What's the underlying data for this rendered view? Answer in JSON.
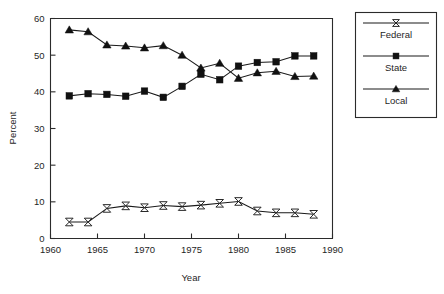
{
  "chart_data": {
    "type": "line",
    "title": "",
    "xlabel": "Year",
    "ylabel": "Percent",
    "xlim": [
      1960,
      1990
    ],
    "ylim": [
      0,
      60
    ],
    "xticks": [
      1960,
      1965,
      1970,
      1975,
      1980,
      1985,
      1990
    ],
    "yticks": [
      0,
      10,
      20,
      30,
      40,
      50,
      60
    ],
    "grid": false,
    "legend_position": "right-outside",
    "x": [
      1962,
      1964,
      1966,
      1968,
      1970,
      1972,
      1974,
      1976,
      1978,
      1980,
      1982,
      1984,
      1986,
      1988
    ],
    "series": [
      {
        "name": "Federal",
        "marker": "bowtie",
        "values": [
          4.5,
          4.5,
          8.2,
          8.9,
          8.4,
          9.0,
          8.7,
          9.1,
          9.6,
          10.1,
          7.5,
          7.0,
          7.0,
          6.6
        ]
      },
      {
        "name": "State",
        "marker": "square",
        "values": [
          38.9,
          39.5,
          39.3,
          38.8,
          40.2,
          38.5,
          41.5,
          44.8,
          43.3,
          47.0,
          48.0,
          48.2,
          49.8,
          49.8
        ]
      },
      {
        "name": "Local",
        "marker": "triangle",
        "values": [
          56.9,
          56.4,
          52.8,
          52.5,
          52.0,
          52.6,
          50.0,
          46.5,
          47.8,
          43.7,
          45.2,
          45.6,
          44.2,
          44.3
        ]
      }
    ]
  },
  "legend": {
    "entries": [
      {
        "label": "Federal",
        "marker": "bowtie"
      },
      {
        "label": "State",
        "marker": "square"
      },
      {
        "label": "Local",
        "marker": "triangle"
      }
    ]
  },
  "axes": {
    "y_title": "Percent",
    "x_title": "Year",
    "y_tick_labels": [
      "0",
      "10",
      "20",
      "30",
      "40",
      "50",
      "60"
    ],
    "x_tick_labels": [
      "1960",
      "1965",
      "1970",
      "1975",
      "1980",
      "1985",
      "1990"
    ]
  },
  "colors": {
    "ink": "#1a1a1a",
    "background": "#ffffff"
  }
}
